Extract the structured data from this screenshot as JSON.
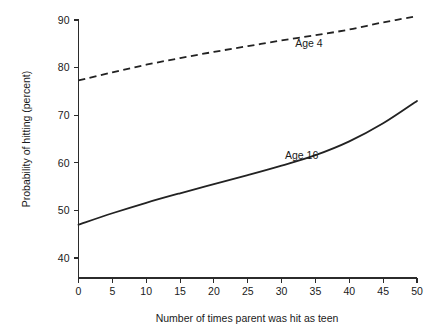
{
  "chart_data": {
    "type": "line",
    "title": "",
    "xlabel": "Number of times parent was hit as teen",
    "ylabel": "Probability of hitting (percent)",
    "xlim": [
      0,
      50
    ],
    "ylim": [
      40,
      90
    ],
    "xticks": [
      0,
      5,
      10,
      15,
      20,
      25,
      30,
      35,
      40,
      45,
      50
    ],
    "xtick_labels": [
      "0",
      "5",
      "10",
      "15",
      "20",
      "25",
      "30",
      "35",
      "40",
      "45",
      "50"
    ],
    "yticks": [
      40,
      50,
      60,
      70,
      80,
      90
    ],
    "ytick_labels": [
      "40",
      "50",
      "60",
      "70",
      "80",
      "90"
    ],
    "grid": false,
    "legend_position": "inline-annotation",
    "x": [
      0,
      5,
      10,
      15,
      20,
      25,
      30,
      35,
      40,
      45,
      50
    ],
    "series": [
      {
        "name": "Age 4",
        "style": "dashed",
        "color": "#222222",
        "label_text": "Age 4",
        "label_x": 32.0,
        "label_y": 85.2,
        "values": [
          77.3,
          79.0,
          80.6,
          82.0,
          83.3,
          84.5,
          85.7,
          86.8,
          88.0,
          89.5,
          90.8
        ]
      },
      {
        "name": "Age 16",
        "style": "solid",
        "color": "#222222",
        "label_text": "Age 16",
        "label_x": 30.5,
        "label_y": 61.5,
        "values": [
          47.0,
          49.4,
          51.6,
          53.6,
          55.5,
          57.4,
          59.4,
          61.6,
          64.5,
          68.3,
          73.0
        ]
      }
    ]
  },
  "axes": {
    "y_axis_name": "y-axis",
    "x_axis_name": "x-axis"
  }
}
